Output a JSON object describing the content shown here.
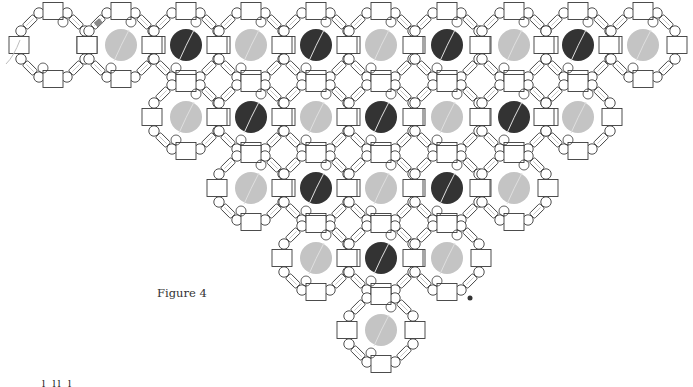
{
  "figure": {
    "caption": "Figure 4",
    "footer_text": "l  ll  l",
    "colors": {
      "outline": "#3a3a3a",
      "gray_bead": "#c4c4c4",
      "dark_bead": "#333333",
      "thread": "#bdbdbd",
      "background": "#ffffff"
    },
    "octagon_radius": 33,
    "rows": [
      {
        "y": 45,
        "cells": [
          {
            "x": 53,
            "fill": "none"
          },
          {
            "x": 121,
            "fill": "gray"
          },
          {
            "x": 186,
            "fill": "dark"
          },
          {
            "x": 251,
            "fill": "gray"
          },
          {
            "x": 316,
            "fill": "dark"
          },
          {
            "x": 381,
            "fill": "gray"
          },
          {
            "x": 447,
            "fill": "dark"
          },
          {
            "x": 514,
            "fill": "gray"
          },
          {
            "x": 578,
            "fill": "dark"
          },
          {
            "x": 643,
            "fill": "gray"
          }
        ]
      },
      {
        "y": 117,
        "cells": [
          {
            "x": 186,
            "fill": "gray"
          },
          {
            "x": 251,
            "fill": "dark"
          },
          {
            "x": 316,
            "fill": "gray"
          },
          {
            "x": 381,
            "fill": "dark"
          },
          {
            "x": 447,
            "fill": "gray"
          },
          {
            "x": 514,
            "fill": "dark"
          },
          {
            "x": 578,
            "fill": "gray"
          }
        ]
      },
      {
        "y": 188,
        "cells": [
          {
            "x": 251,
            "fill": "gray"
          },
          {
            "x": 316,
            "fill": "dark"
          },
          {
            "x": 381,
            "fill": "gray"
          },
          {
            "x": 447,
            "fill": "dark"
          },
          {
            "x": 514,
            "fill": "gray"
          }
        ]
      },
      {
        "y": 258,
        "cells": [
          {
            "x": 316,
            "fill": "gray"
          },
          {
            "x": 381,
            "fill": "dark"
          },
          {
            "x": 447,
            "fill": "gray"
          }
        ]
      },
      {
        "y": 330,
        "cells": [
          {
            "x": 381,
            "fill": "gray"
          }
        ]
      }
    ]
  }
}
